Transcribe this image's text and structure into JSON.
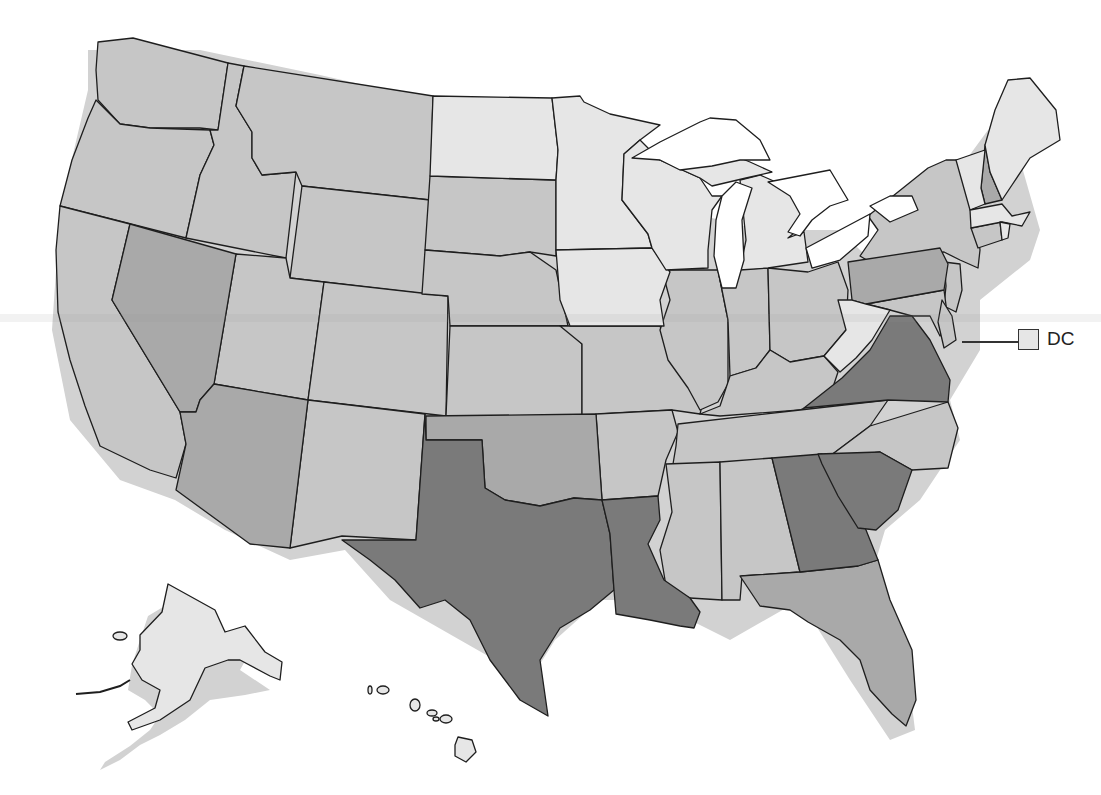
{
  "map": {
    "title": "",
    "type": "choropleth",
    "region": "United States",
    "palette": {
      "tier1_lightest": "#e6e6e6",
      "tier2_light": "#c6c6c6",
      "tier3_medium": "#a9a9a9",
      "tier4_dark": "#7a7a7a",
      "border": "#1e1e1e",
      "background": "#ffffff"
    },
    "tiers": {
      "tier1_lightest": [
        "ND",
        "MN",
        "WI",
        "MI",
        "IA",
        "WV",
        "ME",
        "VT",
        "MA",
        "RI",
        "DC",
        "AK",
        "HI"
      ],
      "tier2_light": [
        "WA",
        "OR",
        "CA",
        "ID",
        "MT",
        "WY",
        "UT",
        "CO",
        "NM",
        "SD",
        "NE",
        "KS",
        "MO",
        "AR",
        "IL",
        "IN",
        "OH",
        "KY",
        "TN",
        "MS",
        "AL",
        "NC",
        "NY",
        "CT",
        "NJ",
        "DE",
        "MD"
      ],
      "tier3_medium": [
        "NV",
        "AZ",
        "OK",
        "PA",
        "NH",
        "FL"
      ],
      "tier4_dark": [
        "TX",
        "LA",
        "GA",
        "SC",
        "VA"
      ]
    },
    "callouts": [
      {
        "state": "DC",
        "label": "DC"
      }
    ]
  }
}
